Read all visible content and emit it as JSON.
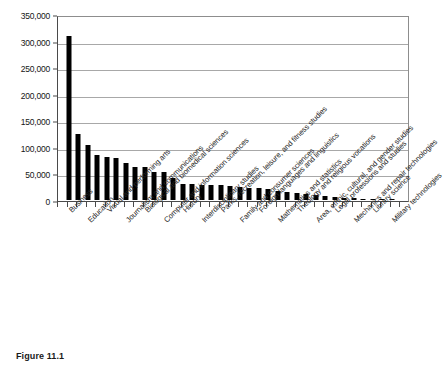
{
  "figure": {
    "caption": "Figure 11.1"
  },
  "chart_data": {
    "type": "bar",
    "title": "",
    "xlabel": "",
    "ylabel": "",
    "ylim": [
      0,
      350000
    ],
    "ytick_interval": 50000,
    "ytick_labels": [
      "0",
      "50,000",
      "100,000",
      "150,000",
      "200,000",
      "250,000",
      "300,000",
      "350,000"
    ],
    "ytick_values": [
      0,
      50000,
      100000,
      150000,
      200000,
      250000,
      300000,
      350000
    ],
    "grid": true,
    "legend": "none",
    "bar_color": "#000000",
    "labeled_categories": [
      "Business",
      "Education",
      "Visual and performing arts",
      "Journalism and communications",
      "Biological and biomedical sciences",
      "Computer and information sciences",
      "History",
      "Interdisciplinary studies",
      "Parks, recreation, leisure, and fitness studies",
      "Family and consumer sciences",
      "Foreign languages and linguistics",
      "Mathematics and statistics",
      "Theology and religious vocations",
      "Area, ethnic, cultural, and gender studies",
      "Legal professions and studies",
      "Mechanics and repair technologies",
      "Library science",
      "Military technologies"
    ],
    "categories": [
      "Business",
      "",
      "Education",
      "",
      "Visual and performing arts",
      "",
      "Journalism and communications",
      "",
      "Biological and biomedical sciences",
      "",
      "Computer and information sciences",
      "",
      "History",
      "",
      "Interdisciplinary studies",
      "",
      "Parks, recreation, leisure, and fitness studies",
      "",
      "Family and consumer sciences",
      "",
      "Foreign languages and linguistics",
      "",
      "Mathematics and statistics",
      "",
      "Theology and religious vocations",
      "",
      "Area, ethnic, cultural, and gender studies",
      "",
      "Legal professions and studies",
      "",
      "Mechanics and repair technologies",
      "",
      "Library science",
      "",
      "Military technologies"
    ],
    "values": [
      312000,
      125000,
      105000,
      85000,
      81000,
      80000,
      71000,
      63000,
      63000,
      53000,
      53000,
      42000,
      30000,
      30000,
      29000,
      28000,
      28000,
      26000,
      25000,
      23000,
      22000,
      21000,
      18000,
      16000,
      14000,
      12000,
      9000,
      7000,
      5000,
      4000,
      3000,
      2000,
      1500,
      800,
      300
    ]
  }
}
